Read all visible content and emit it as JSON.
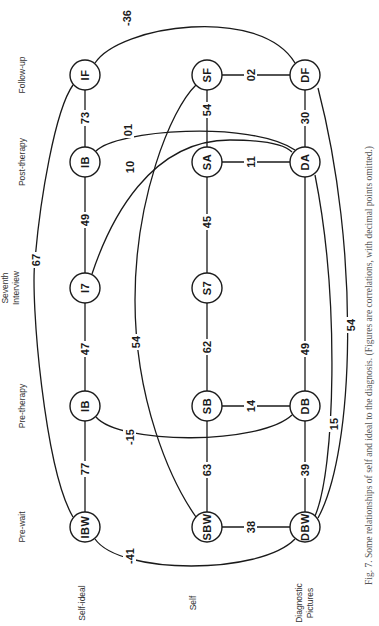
{
  "figure": {
    "caption": "Fig. 7. Some relationships of self and ideal to the diagnosis. (Figures are correlations, with decimal points omitted.)",
    "orientation": "rotated 90° counter-clockwise"
  },
  "columns": [
    {
      "id": "pre-wait",
      "label": "Pre-wait"
    },
    {
      "id": "pre-therapy",
      "label": "Pre-therapy"
    },
    {
      "id": "seventh",
      "label_line1": "Seventh",
      "label_line2": "Interview"
    },
    {
      "id": "post-therapy",
      "label": "Post-therapy"
    },
    {
      "id": "follow-up",
      "label": "Follow-up"
    }
  ],
  "rows": [
    {
      "id": "self-ideal",
      "label": "Self-ideal"
    },
    {
      "id": "self",
      "label": "Self"
    },
    {
      "id": "diagnostic",
      "label_line1": "Diagnostic",
      "label_line2": "Pictures"
    }
  ],
  "nodes": {
    "IBW": "IBW",
    "IB_pre": "IB",
    "I7": "I7",
    "IB_post": "IB",
    "IF": "IF",
    "SBW": "SBW",
    "SB": "SB",
    "S7": "S7",
    "SA": "SA",
    "SF": "SF",
    "DBW": "DBW",
    "DB": "DB",
    "DA": "DA",
    "DF": "DF"
  },
  "edges": {
    "IBW_IBpre": "77",
    "IBpre_I7": "47",
    "I7_IBpost": "49",
    "IBpost_IF": "73",
    "IBW_IF": "67",
    "SBW_SB": "63",
    "SB_S7": "62",
    "S7_SA": "45",
    "SA_SF": "54",
    "SBW_SF": "54",
    "DBW_DB": "39",
    "DB_DA": "49",
    "DA_DF": "30",
    "IBW_DBW": "-41",
    "SBW_DBW": "38",
    "IBpre_DB": "-15",
    "SB_DB": "14",
    "I7_DA": "10",
    "IBpost_DA": "01",
    "SA_DA": "11",
    "IF_DF": "-36",
    "SF_DF": "02",
    "DBW_DA": "15",
    "DBW_DF": "54"
  }
}
